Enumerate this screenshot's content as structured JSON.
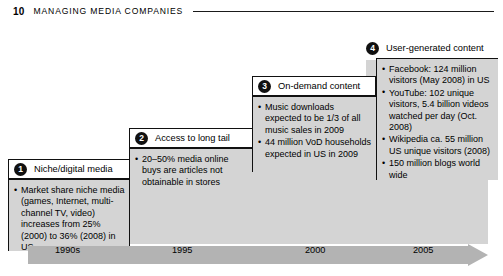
{
  "running_head": {
    "page_number": "10",
    "title": "MANAGING MEDIA COMPANIES"
  },
  "figure": {
    "callouts": [
      {
        "number": "1",
        "title": "Niche/digital media",
        "bullets": [
          "Market share niche media (games, Internet, multi-channel TV, video) increases from 25% (2000) to 36% (2008) in US"
        ]
      },
      {
        "number": "2",
        "title": "Access to long tail",
        "bullets": [
          "20–50% media online buys are articles not obtainable in stores"
        ]
      },
      {
        "number": "3",
        "title": "On-demand content",
        "bullets": [
          "Music downloads expected to be 1/3 of all music sales in 2009",
          "44 million VoD households expected in US in 2009"
        ]
      },
      {
        "number": "4",
        "title": "User-generated content",
        "bullets": [
          "Facebook: 124 million visitors (May 2008) in US",
          "YouTube: 102 unique visitors, 5.4 billion videos watched per day (Oct. 2008)",
          "Wikipedia ca. 55 million US unique visitors (2008)",
          "150 million blogs world wide"
        ]
      }
    ],
    "timeline": {
      "ticks": [
        "1990s",
        "1995",
        "2000",
        "2005"
      ],
      "arrow_color": "#b3b3b3"
    },
    "panel_color": "#d4d4d4",
    "border_color": "#111111"
  }
}
